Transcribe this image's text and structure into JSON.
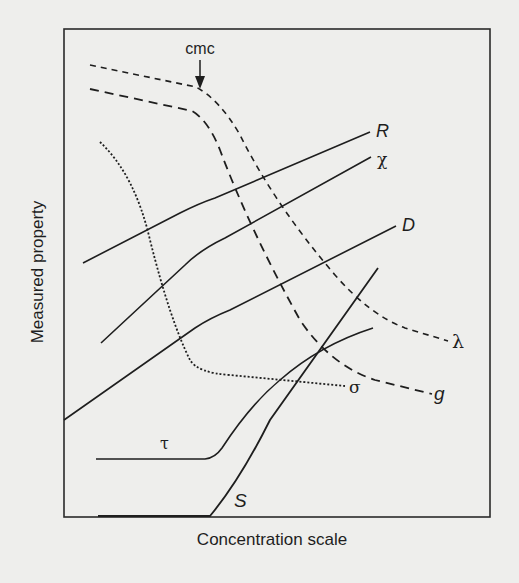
{
  "figure": {
    "x_axis_label": "Concentration scale",
    "y_axis_label": "Measured property",
    "cmc_label": "cmc",
    "curves": [
      {
        "id": "R",
        "label": "R",
        "style": "solid",
        "description": "rises with a change of slope at cmc"
      },
      {
        "id": "chi",
        "label": "χ",
        "style": "solid",
        "description": "rises with a change of slope at cmc"
      },
      {
        "id": "D",
        "label": "D",
        "style": "solid",
        "description": "rises with a change of slope at cmc"
      },
      {
        "id": "lambda",
        "label": "λ",
        "style": "dashed",
        "description": "flat then falls after cmc"
      },
      {
        "id": "g",
        "label": "g",
        "style": "dashed",
        "description": "flat then falls steeply after cmc"
      },
      {
        "id": "sigma",
        "label": "σ",
        "style": "dotted",
        "description": "falls then levels off at cmc"
      },
      {
        "id": "tau",
        "label": "τ",
        "style": "solid",
        "description": "flat until cmc then rises"
      },
      {
        "id": "S",
        "label": "S",
        "style": "solid",
        "description": "zero until cmc then rises linearly"
      }
    ]
  },
  "colors": {
    "background": "#eeeeec",
    "ink": "#1e1e1e"
  }
}
